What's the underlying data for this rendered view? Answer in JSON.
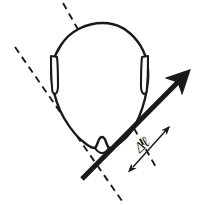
{
  "figure": {
    "background_color": "#ffffff",
    "stroke_color": "#1a1a1a",
    "width": 205,
    "height": 205
  },
  "labels": {
    "delta_l": "Δℓ",
    "delta_l_rotation_deg": -42
  },
  "elements": {
    "head_name": "head-outline",
    "left_ear_name": "left-ear",
    "right_ear_name": "right-ear",
    "chin_name": "chin-notch",
    "arrow_name": "displacement-arrow",
    "dashed_axis_a_name": "dashed-reference-line-a",
    "dashed_axis_b_name": "dashed-reference-line-b",
    "dashed_tick_a_name": "dashed-tick-line-a",
    "dashed_tick_b_name": "dashed-tick-line-b",
    "measure_arrow_name": "delta-l-double-arrow"
  },
  "geometry": {
    "arrow_start": [
      82,
      179
    ],
    "arrow_end": [
      187,
      73
    ],
    "arrow_stroke_width": 5,
    "dashed_line_a_start": [
      15,
      47
    ],
    "dashed_line_a_end": [
      122,
      201
    ],
    "dashed_line_b_start": [
      63,
      3
    ],
    "dashed_line_b_end": [
      157,
      169
    ],
    "dash_pattern": "7 5",
    "dash_stroke_width": 2,
    "measure_arrow_start": [
      132,
      168
    ],
    "measure_arrow_end": [
      170,
      126
    ]
  },
  "colors": {
    "ink": "#1a1a1a",
    "paper": "#ffffff"
  }
}
